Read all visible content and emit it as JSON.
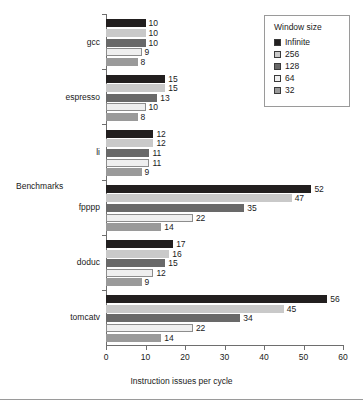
{
  "chart_data": {
    "type": "bar",
    "orientation": "horizontal",
    "title": "",
    "xlabel": "Instruction issues per cycle",
    "ylabel": "Benchmarks",
    "xlim": [
      0,
      60
    ],
    "xticks": [
      0,
      10,
      20,
      30,
      40,
      50,
      60
    ],
    "grid": false,
    "legend_title": "Window size",
    "legend_position": "top-right",
    "categories": [
      "gcc",
      "espresso",
      "li",
      "fpppp",
      "doduc",
      "tomcatv"
    ],
    "series": [
      {
        "name": "Infinite",
        "color": "#221f1f",
        "values": [
          10,
          15,
          12,
          52,
          17,
          56
        ]
      },
      {
        "name": "256",
        "color": "#c9c9c9",
        "values": [
          10,
          15,
          12,
          47,
          16,
          45
        ]
      },
      {
        "name": "128",
        "color": "#696969",
        "values": [
          10,
          13,
          11,
          35,
          15,
          34
        ]
      },
      {
        "name": "64",
        "color": "#efefef",
        "values": [
          9,
          10,
          11,
          22,
          12,
          22
        ]
      },
      {
        "name": "32",
        "color": "#9a9a9a",
        "values": [
          8,
          8,
          9,
          14,
          9,
          14
        ]
      }
    ]
  },
  "legend": {
    "title": "Window size",
    "items": [
      {
        "label": "Infinite",
        "color": "#221f1f"
      },
      {
        "label": "256",
        "color": "#c9c9c9"
      },
      {
        "label": "128",
        "color": "#696969"
      },
      {
        "label": "64",
        "color": "#efefef"
      },
      {
        "label": "32",
        "color": "#9a9a9a"
      }
    ]
  },
  "axes": {
    "x_title": "Instruction issues per cycle",
    "y_title": "Benchmarks",
    "x_tick_labels": [
      "0",
      "10",
      "20",
      "30",
      "40",
      "50",
      "60"
    ]
  }
}
